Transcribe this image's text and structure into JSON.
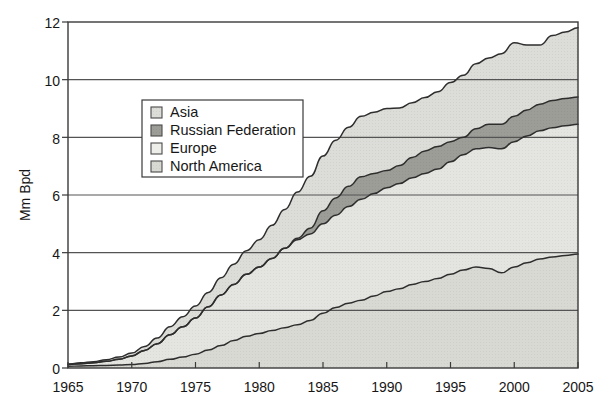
{
  "chart_data": {
    "type": "area",
    "stacked": true,
    "title": "",
    "xlabel": "",
    "ylabel": "Mm Bpd",
    "xlim": [
      1965,
      2005
    ],
    "ylim": [
      0,
      12
    ],
    "xticks": [
      "1965",
      "1970",
      "1975",
      "1980",
      "1985",
      "1990",
      "1995",
      "2000",
      "2005"
    ],
    "yticks": [
      "0",
      "2",
      "4",
      "6",
      "8",
      "10",
      "12"
    ],
    "grid": "horizontal",
    "legend_position": "upper-left-inside",
    "stack_order_bottom_to_top": [
      "North America",
      "Europe",
      "Russian Federation",
      "Asia"
    ],
    "x": [
      1965,
      1966,
      1967,
      1968,
      1969,
      1970,
      1971,
      1972,
      1973,
      1974,
      1975,
      1976,
      1977,
      1978,
      1979,
      1980,
      1981,
      1982,
      1983,
      1984,
      1985,
      1986,
      1987,
      1988,
      1989,
      1990,
      1991,
      1992,
      1993,
      1994,
      1995,
      1996,
      1997,
      1998,
      1999,
      2000,
      2001,
      2002,
      2003,
      2004,
      2005
    ],
    "series": [
      {
        "name": "North America",
        "color": "#d9d9d4",
        "values": [
          0.06,
          0.07,
          0.08,
          0.09,
          0.1,
          0.12,
          0.16,
          0.22,
          0.3,
          0.38,
          0.48,
          0.62,
          0.78,
          0.95,
          1.1,
          1.2,
          1.3,
          1.4,
          1.5,
          1.65,
          1.9,
          2.1,
          2.25,
          2.35,
          2.5,
          2.65,
          2.75,
          2.9,
          3.0,
          3.1,
          3.25,
          3.4,
          3.5,
          3.45,
          3.3,
          3.5,
          3.65,
          3.78,
          3.85,
          3.9,
          3.95
        ]
      },
      {
        "name": "Europe",
        "color": "#dedeDa",
        "values": [
          0.06,
          0.08,
          0.1,
          0.14,
          0.2,
          0.3,
          0.45,
          0.62,
          0.85,
          1.05,
          1.25,
          1.5,
          1.75,
          1.95,
          2.15,
          2.3,
          2.5,
          2.75,
          2.95,
          3.0,
          3.1,
          3.2,
          3.35,
          3.5,
          3.55,
          3.6,
          3.65,
          3.7,
          3.75,
          3.8,
          3.9,
          4.0,
          4.1,
          4.2,
          4.3,
          4.35,
          4.4,
          4.45,
          4.48,
          4.5,
          4.5
        ]
      },
      {
        "name": "Russian Federation",
        "color": "#9d9d98",
        "values": [
          0,
          0,
          0,
          0,
          0,
          0,
          0,
          0,
          0,
          0,
          0,
          0,
          0,
          0,
          0,
          0,
          0,
          0,
          0.05,
          0.2,
          0.45,
          0.6,
          0.7,
          0.78,
          0.7,
          0.6,
          0.62,
          0.7,
          0.78,
          0.78,
          0.7,
          0.6,
          0.7,
          0.8,
          0.85,
          0.88,
          0.9,
          0.92,
          0.95,
          0.95,
          0.95
        ]
      },
      {
        "name": "Asia",
        "color": "#dcdcd8",
        "values": [
          0.02,
          0.03,
          0.04,
          0.06,
          0.08,
          0.1,
          0.14,
          0.2,
          0.28,
          0.35,
          0.42,
          0.5,
          0.6,
          0.7,
          0.82,
          0.95,
          1.15,
          1.35,
          1.6,
          1.8,
          1.9,
          2.0,
          2.05,
          2.1,
          2.12,
          2.15,
          2.0,
          1.9,
          1.85,
          1.9,
          2.05,
          2.15,
          2.25,
          2.3,
          2.45,
          2.55,
          2.25,
          2.05,
          2.25,
          2.3,
          2.4
        ]
      }
    ],
    "cumulative_top_values": [
      0.14,
      0.18,
      0.22,
      0.29,
      0.38,
      0.52,
      0.75,
      1.04,
      1.43,
      1.78,
      2.15,
      2.62,
      3.13,
      3.6,
      4.07,
      4.45,
      4.95,
      5.5,
      6.1,
      6.65,
      7.35,
      7.9,
      8.35,
      8.73,
      8.87,
      9.0,
      9.02,
      9.2,
      9.38,
      9.58,
      9.9,
      10.15,
      10.55,
      10.75,
      10.9,
      11.28,
      11.2,
      11.2,
      11.53,
      11.65,
      11.8
    ]
  },
  "legend": {
    "items": [
      {
        "label": "Asia",
        "swatch_color": "#dcdcd8"
      },
      {
        "label": "Russian Federation",
        "swatch_color": "#9d9d98"
      },
      {
        "label": "Europe",
        "swatch_color": "#ededea"
      },
      {
        "label": "North America",
        "swatch_color": "#d9d9d4"
      }
    ]
  },
  "axes": {
    "y_title": "Mm Bpd",
    "y_tick_0": "0",
    "y_tick_2": "2",
    "y_tick_4": "4",
    "y_tick_6": "6",
    "y_tick_8": "8",
    "y_tick_10": "10",
    "y_tick_12": "12",
    "x_tick_1965": "1965",
    "x_tick_1970": "1970",
    "x_tick_1975": "1975",
    "x_tick_1980": "1980",
    "x_tick_1985": "1985",
    "x_tick_1990": "1990",
    "x_tick_1995": "1995",
    "x_tick_2000": "2000",
    "x_tick_2005": "2005"
  }
}
